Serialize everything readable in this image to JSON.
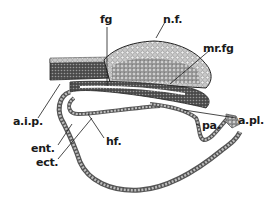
{
  "figure": {
    "type": "histological-section-drawing",
    "labels": {
      "fg": "fg",
      "nf": "n.f.",
      "mrfg": "mr.fg",
      "aip": "a.i.p.",
      "apl": "a.pl.",
      "pa": "pa.",
      "hf": "hf.",
      "ent": "ent.",
      "ect": "ect."
    },
    "colors": {
      "ink": "#1a1a1a",
      "tissue_dark": "#3a3a3a",
      "tissue_mid": "#6b6b6b",
      "tissue_light": "#b5b5b5",
      "background": "#ffffff"
    }
  }
}
